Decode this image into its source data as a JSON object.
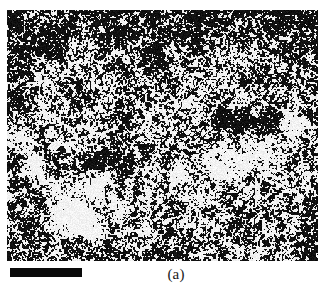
{
  "figure": {
    "caption": "(a)",
    "panel_label": "a",
    "image_type": "grayscale-micrograph",
    "colors": {
      "background": "#ffffff",
      "ink": "#1a1a1a",
      "scale_bar": "#0a0a0a",
      "micrograph_dark": "#101010",
      "micrograph_light": "#f2f2f2"
    },
    "panel_bounds": {
      "x": 7,
      "y": 10,
      "width": 311,
      "height": 251
    }
  },
  "scale_bar": {
    "label": "",
    "x": 10,
    "y": 268,
    "width": 72,
    "height": 9,
    "color": "#0a0a0a"
  },
  "texture": {
    "seed": 20240517,
    "grain_size_px": 2,
    "base_threshold": 0.5,
    "vignette_strength": 0.16,
    "blob_count": 26,
    "notes": "binary black/white speckle, darker toward top and left edges"
  }
}
